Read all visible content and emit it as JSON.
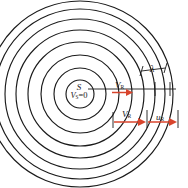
{
  "figure": {
    "type": "physics-diagram",
    "colors": {
      "wavefront": "#1a1a1a",
      "arrow": "#d8442c",
      "tick": "#1a1a1a",
      "background": "#ffffff"
    },
    "source": {
      "symbol": "S",
      "velocity_label": "V",
      "velocity_subscript": "S",
      "velocity_value": "=0",
      "velocity_full": "V_S=0"
    },
    "receiver": {
      "symbol": "V",
      "subscript": "R",
      "top_label": "V_R",
      "bottom_label": "V_R"
    },
    "speed_label": {
      "symbol": "u",
      "subscript": "R",
      "full": "u_R"
    },
    "wavelength": {
      "symbol": "λ"
    },
    "wavefronts": {
      "count": 8,
      "center_x": 80,
      "center_y": 94,
      "radii": [
        14,
        26,
        39,
        52,
        65,
        77,
        88,
        96
      ]
    }
  }
}
